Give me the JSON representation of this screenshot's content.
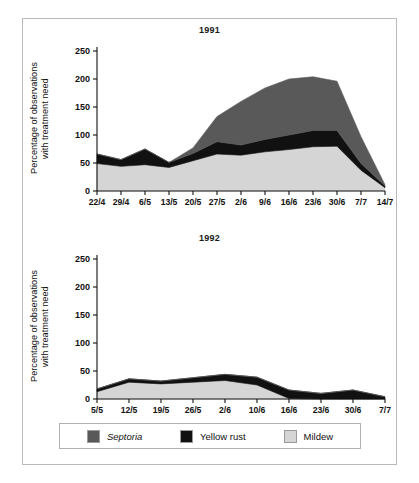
{
  "figure": {
    "ylabel": "Percentage of observations\nwith treatment need"
  },
  "legend": {
    "items": [
      {
        "label": "Septoria",
        "color": "#59595a",
        "italic": true,
        "name": "septoria"
      },
      {
        "label": "Yellow rust",
        "color": "#111111",
        "italic": false,
        "name": "yellow-rust"
      },
      {
        "label": "Mildew",
        "color": "#d5d5d5",
        "italic": false,
        "name": "mildew"
      }
    ]
  },
  "chart_data": [
    {
      "type": "area",
      "stacked": true,
      "title": "1991",
      "xlabel": "",
      "ylabel": "Percentage of observations with treatment need",
      "ylim": [
        0,
        250
      ],
      "yticks": [
        0,
        50,
        100,
        150,
        200,
        250
      ],
      "ytick_labels": [
        "0",
        "50",
        "100",
        "150",
        "200",
        "250"
      ],
      "grid": false,
      "legend_position": "bottom",
      "categories": [
        "22/4",
        "29/4",
        "6/5",
        "13/5",
        "20/5",
        "27/5",
        "2/6",
        "9/6",
        "16/6",
        "23/6",
        "30/6",
        "7/7",
        "14/7"
      ],
      "series": [
        {
          "name": "Mildew",
          "color": "#d5d5d5",
          "values": [
            49,
            44,
            47,
            42,
            54,
            66,
            64,
            70,
            74,
            79,
            80,
            37,
            6
          ]
        },
        {
          "name": "Yellow rust",
          "color": "#111111",
          "values": [
            17,
            12,
            28,
            9,
            13,
            22,
            18,
            22,
            26,
            29,
            28,
            12,
            3
          ]
        },
        {
          "name": "Septoria",
          "color": "#59595a",
          "values": [
            0,
            0,
            0,
            0,
            10,
            45,
            78,
            92,
            100,
            96,
            88,
            48,
            2
          ]
        }
      ],
      "totals": [
        66,
        56,
        75,
        51,
        77,
        133,
        160,
        184,
        200,
        204,
        196,
        97,
        11
      ]
    },
    {
      "type": "area",
      "stacked": true,
      "title": "1992",
      "xlabel": "",
      "ylabel": "Percentage of observations with treatment need",
      "ylim": [
        0,
        250
      ],
      "yticks": [
        0,
        50,
        100,
        150,
        200,
        250
      ],
      "ytick_labels": [
        "0",
        "50",
        "100",
        "150",
        "200",
        "250"
      ],
      "grid": false,
      "legend_position": "bottom",
      "categories": [
        "5/5",
        "12/5",
        "19/5",
        "26/5",
        "2/6",
        "10/6",
        "16/6",
        "23/6",
        "30/6",
        "7/7"
      ],
      "series": [
        {
          "name": "Mildew",
          "color": "#d5d5d5",
          "values": [
            13,
            30,
            27,
            30,
            33,
            25,
            1,
            0,
            0,
            0
          ]
        },
        {
          "name": "Yellow rust",
          "color": "#111111",
          "values": [
            5,
            6,
            5,
            8,
            11,
            14,
            15,
            10,
            16,
            4
          ]
        },
        {
          "name": "Septoria",
          "color": "#59595a",
          "values": [
            0,
            0,
            0,
            0,
            0,
            0,
            0,
            0,
            0,
            0
          ]
        }
      ],
      "totals": [
        18,
        36,
        32,
        38,
        44,
        39,
        16,
        10,
        16,
        4
      ]
    }
  ]
}
